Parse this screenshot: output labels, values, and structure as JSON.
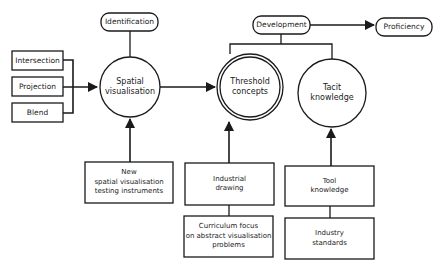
{
  "diagram": {
    "colors": {
      "stroke": "#1a1a1a",
      "background": "#ffffff",
      "text": "#1a1a1a"
    },
    "top_labels": {
      "identification": "Identification",
      "development": "Development",
      "proficiency": "Proficiency"
    },
    "inputs": {
      "intersection": "Intersection",
      "projection": "Projection",
      "blend": "Blend"
    },
    "circles": {
      "spatial_visualisation": {
        "line1": "Spatial",
        "line2": "visualisation"
      },
      "threshold_concepts": {
        "line1": "Threshold",
        "line2": "concepts"
      },
      "tacit_knowledge": {
        "line1": "Tacit",
        "line2": "knowledge"
      }
    },
    "boxes": {
      "new_testing": {
        "line1": "New",
        "line2": "spatial visualisation",
        "line3": "testing instruments"
      },
      "industrial_drawing": {
        "line1": "Industrial",
        "line2": "drawing"
      },
      "curriculum_focus": {
        "line1": "Curriculum focus",
        "line2": "on abstract visualisation",
        "line3": "problems"
      },
      "tool_knowledge": {
        "line1": "Tool",
        "line2": "knowledge"
      },
      "industry_standards": {
        "line1": "Industry",
        "line2": "standards"
      }
    }
  }
}
